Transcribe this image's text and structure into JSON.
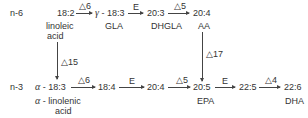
{
  "rows": {
    "n6": {
      "label": "n-6",
      "nodes": [
        {
          "id": "18_2",
          "text": "18:2",
          "name": "linoleic",
          "name2": "acid"
        },
        {
          "id": "18_3_gamma",
          "greek": "γ",
          "text": " - 18:3",
          "name": "GLA"
        },
        {
          "id": "20_3",
          "text": "20:3",
          "name": "DHGLA"
        },
        {
          "id": "20_4_aa",
          "text": "20:4",
          "name": "AA"
        }
      ],
      "enzymes": [
        "△6",
        "E",
        "△5"
      ]
    },
    "n3": {
      "label": "n-3",
      "nodes": [
        {
          "id": "18_3_alpha",
          "greek": "α",
          "text": " - 18:3",
          "name_greek": "α",
          "name": " - linolenic",
          "name2": "acid"
        },
        {
          "id": "18_4",
          "text": "18:4"
        },
        {
          "id": "20_4",
          "text": "20:4"
        },
        {
          "id": "20_5",
          "text": "20:5",
          "name": "EPA"
        },
        {
          "id": "22_5",
          "text": "22:5"
        },
        {
          "id": "22_6",
          "text": "22:6",
          "name": "DHA"
        }
      ],
      "enzymes": [
        "△6",
        "E",
        "△5",
        "E",
        "△4"
      ]
    }
  },
  "cross_links": [
    {
      "from": "18_2",
      "to": "18_3_alpha",
      "enzyme": "△15"
    },
    {
      "from": "20_4_aa",
      "to": "20_5",
      "enzyme": "△17"
    }
  ]
}
